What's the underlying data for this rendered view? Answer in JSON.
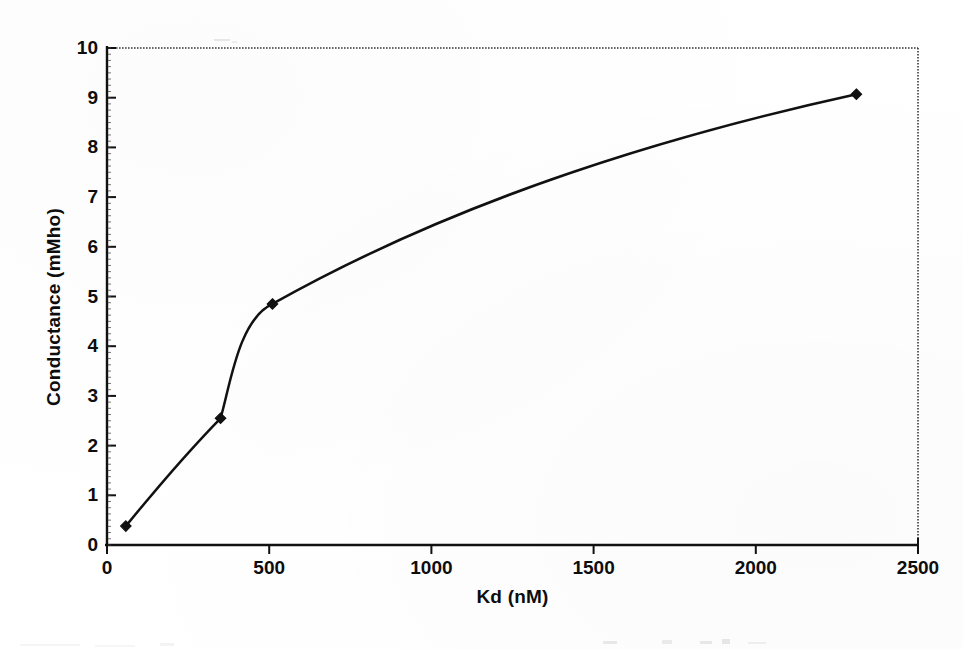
{
  "chart_data": {
    "type": "line",
    "title": "",
    "xlabel": "Kd (nM)",
    "ylabel": "Conductance (mMho)",
    "xlim": [
      0,
      2500
    ],
    "ylim": [
      0,
      10
    ],
    "xticks": [
      "0",
      "500",
      "1000",
      "1500",
      "2000",
      "2500"
    ],
    "xtick_values": [
      0,
      500,
      1000,
      1500,
      2000,
      2500
    ],
    "yticks": [
      "0",
      "1",
      "2",
      "3",
      "4",
      "5",
      "6",
      "7",
      "8",
      "9",
      "10"
    ],
    "ytick_values": [
      0,
      1,
      2,
      3,
      4,
      5,
      6,
      7,
      8,
      9,
      10
    ],
    "grid": false,
    "legend": "none",
    "marker": "diamond",
    "line_color": "#111111",
    "marker_color": "#111111",
    "series": [
      {
        "name": "Conductance vs Kd",
        "points": [
          {
            "x": 58,
            "y": 0.38
          },
          {
            "x": 350,
            "y": 2.55
          },
          {
            "x": 510,
            "y": 4.85
          },
          {
            "x": 2310,
            "y": 9.07
          }
        ]
      }
    ],
    "curve_note": "smoothed sigmoidal interpolation through the four measured points"
  },
  "axes": {
    "x_axis_name": "Kd (nM)",
    "y_axis_name": "Conductance (mMho)",
    "x_units": "nM",
    "y_units": "mMho"
  },
  "icons": {
    "data_point": "diamond-marker"
  }
}
